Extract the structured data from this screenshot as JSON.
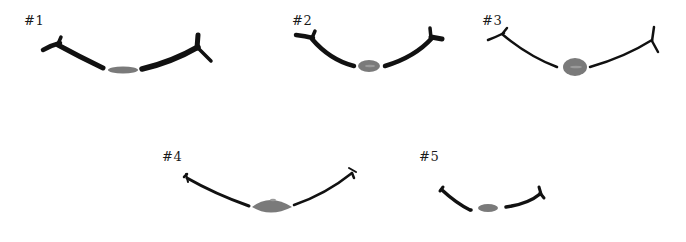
{
  "figures": [
    {
      "id": 1,
      "label": "#1"
    },
    {
      "id": 2,
      "label": "#2"
    },
    {
      "id": 3,
      "label": "#3"
    },
    {
      "id": 4,
      "label": "#4"
    },
    {
      "id": 5,
      "label": "#5"
    }
  ],
  "colors": {
    "ink": "#111111",
    "spot": "#7a7a7a",
    "background": "#ffffff"
  }
}
